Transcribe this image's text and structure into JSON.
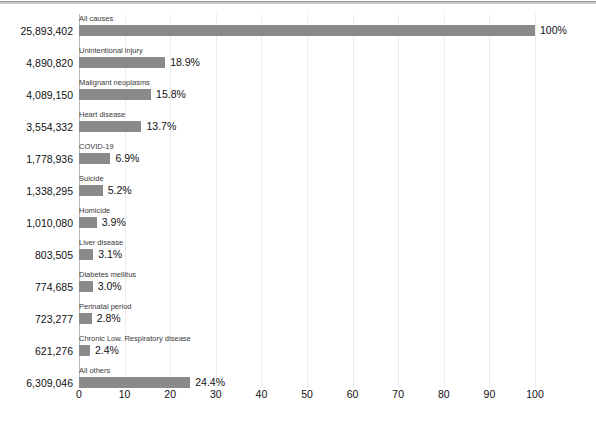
{
  "chart_data": {
    "type": "bar",
    "orientation": "horizontal",
    "title": "",
    "subtitle": "",
    "xlabel": "",
    "ylabel": "",
    "xlim": [
      0,
      100
    ],
    "xticks": [
      0,
      10,
      20,
      30,
      40,
      50,
      60,
      70,
      80,
      90,
      100
    ],
    "xtick_labels": [
      "0",
      "10",
      "20",
      "30",
      "40",
      "50",
      "60",
      "70",
      "80",
      "90",
      "100"
    ],
    "grid": true,
    "legend": null,
    "bar_color": "#8a8a8a",
    "gridline_color": "#ececec",
    "categories": [
      "All causes",
      "Unintentional injury",
      "Malignant neoplasms",
      "Heart disease",
      "COVID-19",
      "Suicide",
      "Homicide",
      "Liver disease",
      "Diabetes mellitus",
      "Perinatal period",
      "Chronic Low. Respiratory disease",
      "All others"
    ],
    "values": [
      100.0,
      18.9,
      15.8,
      13.7,
      6.9,
      5.2,
      3.9,
      3.1,
      3.0,
      2.8,
      2.4,
      24.4
    ],
    "value_labels": [
      "100%",
      "18.9%",
      "15.8%",
      "13.7%",
      "6.9%",
      "5.2%",
      "3.9%",
      "3.1%",
      "3.0%",
      "2.8%",
      "2.4%",
      "24.4%"
    ],
    "counts": [
      "25,893,402",
      "4,890,820",
      "4,089,150",
      "3,554,332",
      "1,778,936",
      "1,338,295",
      "1,010,080",
      "803,505",
      "774,685",
      "723,277",
      "621,276",
      "6,309,046"
    ]
  }
}
